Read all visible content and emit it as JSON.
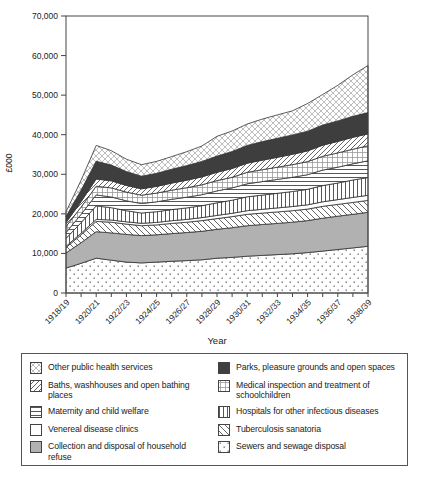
{
  "colors": {
    "background": "#ffffff",
    "band_gray": "#b1b1b1",
    "band_dark": "#3e3e3e",
    "axis": "#444444",
    "text": "#222222",
    "hatch_dark": "#555555",
    "hatch_light": "#999999"
  },
  "chart_data": {
    "type": "area",
    "stacked": true,
    "title": "",
    "xlabel": "Year",
    "ylabel": "£000",
    "ylim": [
      0,
      70000
    ],
    "y_tick_step": 10000,
    "y_ticks": [
      "0",
      "10,000",
      "20,000",
      "30,000",
      "40,000",
      "50,000",
      "60,000",
      "70,000"
    ],
    "x": [
      "1918/19",
      "1919/20",
      "1920/21",
      "1921/22",
      "1922/23",
      "1923/24",
      "1924/25",
      "1925/26",
      "1926/27",
      "1927/28",
      "1928/29",
      "1929/30",
      "1930/31",
      "1931/32",
      "1932/33",
      "1933/34",
      "1934/35",
      "1935/36",
      "1936/37",
      "1937/38",
      "1938/39"
    ],
    "x_labels_shown": [
      "1918/19",
      "1920/21",
      "1922/23",
      "1924/25",
      "1926/27",
      "1928/29",
      "1930/31",
      "1932/33",
      "1934/35",
      "1936/37",
      "1938/39"
    ],
    "grid": false,
    "legend_position": "bottom",
    "series": [
      {
        "id": "sewers",
        "name": "Sewers and sewage disposal",
        "pattern": "dots",
        "values": [
          6300,
          7500,
          8800,
          8300,
          7800,
          7600,
          7800,
          8000,
          8200,
          8400,
          8800,
          9000,
          9300,
          9500,
          9700,
          9900,
          10200,
          10600,
          11000,
          11400,
          11800
        ]
      },
      {
        "id": "refuse",
        "name": "Collection and disposal of household refuse",
        "pattern": "solid-gray",
        "values": [
          3800,
          5200,
          6700,
          6900,
          7000,
          6900,
          6900,
          7000,
          7100,
          7200,
          7300,
          7500,
          7700,
          7800,
          7900,
          8000,
          8100,
          8300,
          8400,
          8500,
          8600
        ]
      },
      {
        "id": "tuberculosis",
        "name": "Tuberculosis sanatoria",
        "pattern": "diag-back",
        "values": [
          1400,
          2000,
          2600,
          2700,
          2600,
          2500,
          2500,
          2600,
          2600,
          2700,
          2700,
          2800,
          2900,
          2900,
          2900,
          2900,
          2900,
          3000,
          3000,
          3000,
          3000
        ]
      },
      {
        "id": "venereal",
        "name": "Venereal disease clinics",
        "pattern": "plain",
        "values": [
          300,
          400,
          500,
          550,
          600,
          620,
          650,
          680,
          700,
          750,
          800,
          850,
          900,
          950,
          1000,
          1050,
          1100,
          1150,
          1200,
          1250,
          1300
        ]
      },
      {
        "id": "hospitals",
        "name": "Hospitals for other infectious diseases",
        "pattern": "vlines",
        "values": [
          2000,
          2700,
          3400,
          3100,
          2800,
          2600,
          2700,
          2800,
          2900,
          3000,
          3200,
          3300,
          3500,
          3600,
          3700,
          3800,
          3900,
          4100,
          4200,
          4400,
          4500
        ]
      },
      {
        "id": "maternity",
        "name": "Maternity and child welfare",
        "pattern": "hlines",
        "values": [
          1500,
          2100,
          2800,
          2700,
          2500,
          2400,
          2500,
          2600,
          2700,
          2800,
          3000,
          3100,
          3300,
          3400,
          3500,
          3600,
          3700,
          3900,
          4000,
          4100,
          4200
        ]
      },
      {
        "id": "medical-inspection",
        "name": "Medical inspection and treatment of schoolchildren",
        "pattern": "grid",
        "values": [
          1500,
          1800,
          2200,
          2300,
          2200,
          2100,
          2200,
          2300,
          2400,
          2500,
          2600,
          2700,
          2900,
          3000,
          3100,
          3200,
          3300,
          3500,
          3600,
          3700,
          3800
        ]
      },
      {
        "id": "baths",
        "name": "Baths, washhouses and open bathing places",
        "pattern": "diag-fwd",
        "values": [
          1000,
          1400,
          1800,
          1800,
          1700,
          1600,
          1700,
          1800,
          1900,
          2000,
          2100,
          2200,
          2300,
          2400,
          2500,
          2600,
          2700,
          2800,
          2900,
          3000,
          3000
        ]
      },
      {
        "id": "parks",
        "name": "Parks, pleasure grounds and open spaces",
        "pattern": "solid-dark",
        "values": [
          1500,
          2900,
          4500,
          4000,
          3500,
          3200,
          3300,
          3500,
          3700,
          3900,
          4100,
          4300,
          4500,
          4700,
          4800,
          4900,
          5000,
          5100,
          5200,
          5300,
          5400
        ]
      },
      {
        "id": "other",
        "name": "Other public health services",
        "pattern": "diamond-mesh",
        "values": [
          1200,
          2500,
          4000,
          3600,
          3100,
          2900,
          3000,
          3200,
          3500,
          3900,
          5000,
          5200,
          5400,
          5700,
          5900,
          6100,
          7000,
          7700,
          9000,
          10500,
          11900
        ]
      }
    ]
  },
  "legend": {
    "columns": [
      {
        "items": [
          {
            "label": "Other public health services",
            "pattern": "diamond-mesh"
          },
          {
            "label": "Baths, washhouses and open bathing places",
            "pattern": "diag-fwd"
          },
          {
            "label": "Maternity and child welfare",
            "pattern": "hlines"
          },
          {
            "label": "Venereal disease clinics",
            "pattern": "plain"
          },
          {
            "label": "Collection and disposal of household refuse",
            "pattern": "solid-gray"
          }
        ]
      },
      {
        "items": [
          {
            "label": "Parks, pleasure grounds and open spaces",
            "pattern": "solid-dark"
          },
          {
            "label": "Medical inspection and treatment of schoolchildren",
            "pattern": "grid"
          },
          {
            "label": "Hospitals for other infectious diseases",
            "pattern": "vlines"
          },
          {
            "label": "Tuberculosis sanatoria",
            "pattern": "diag-back"
          },
          {
            "label": "Sewers and sewage disposal",
            "pattern": "dots"
          }
        ]
      }
    ]
  }
}
